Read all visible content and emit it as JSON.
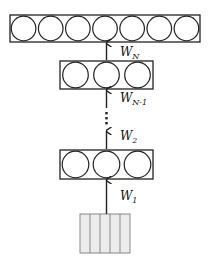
{
  "diagram": {
    "type": "neural-network-stack",
    "colors": {
      "stroke": "#222222",
      "input_fill": "#ececec",
      "background": "#ffffff"
    },
    "layers": [
      {
        "id": "output",
        "neurons": 7,
        "x": 10,
        "y": 15,
        "w": 190,
        "h": 27
      },
      {
        "id": "hidden-n-1",
        "neurons": 3,
        "x": 60,
        "y": 61,
        "w": 93,
        "h": 28
      },
      {
        "id": "hidden-1",
        "neurons": 3,
        "x": 60,
        "y": 150,
        "w": 93,
        "h": 29
      }
    ],
    "input": {
      "id": "input",
      "strips": 5,
      "x": 80,
      "y": 214,
      "w": 50,
      "h": 39
    },
    "weights": [
      {
        "base": "W",
        "sub": "N",
        "x": 120,
        "y": 56
      },
      {
        "base": "W",
        "sub": "N-1",
        "x": 120,
        "y": 102
      },
      {
        "base": "W",
        "sub": "2",
        "x": 120,
        "y": 140
      },
      {
        "base": "W",
        "sub": "1",
        "x": 120,
        "y": 200
      }
    ],
    "ellipsis": "⋮"
  }
}
